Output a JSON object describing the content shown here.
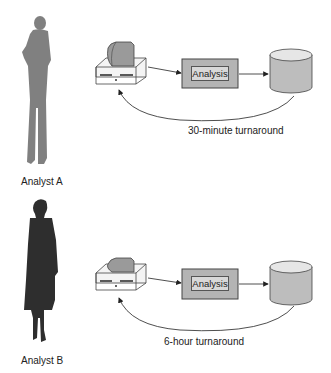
{
  "rows": [
    {
      "analyst": "Analyst A",
      "process_label": "Analysis",
      "turnaround": "30-minute turnaround"
    },
    {
      "analyst": "Analyst B",
      "process_label": "Analysis",
      "turnaround": "6-hour turnaround"
    }
  ],
  "colors": {
    "analyst_a": "#808080",
    "analyst_b": "#2e2e2e",
    "box_fill": "#b4b4b4",
    "stroke": "#333333"
  }
}
